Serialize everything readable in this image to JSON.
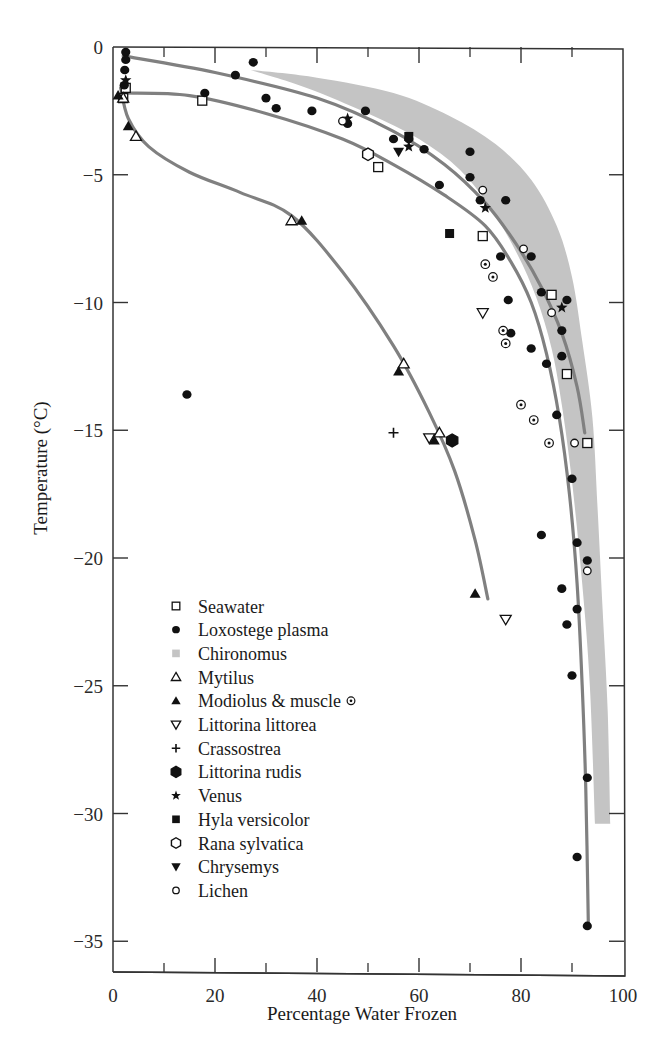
{
  "chart_data": {
    "type": "scatter",
    "title": "",
    "xlabel": "Percentage Water Frozen",
    "ylabel": "Temperature (°C)",
    "xlim": [
      0,
      100
    ],
    "ylim": [
      -36,
      0
    ],
    "x_ticks": [
      0,
      20,
      40,
      60,
      80,
      100
    ],
    "x_minor_ticks": [
      10,
      30,
      50,
      70,
      90
    ],
    "y_ticks": [
      0,
      -5,
      -10,
      -15,
      -20,
      -25,
      -30,
      -35
    ],
    "x_tick_labels": [
      "0",
      "20",
      "40",
      "60",
      "80",
      "100"
    ],
    "y_tick_labels": [
      "0",
      "−5",
      "−10",
      "−15",
      "−20",
      "−25",
      "−30",
      "−35"
    ],
    "grid": false,
    "legend_position": "lower-left inside",
    "colors": {
      "curve": "#808080",
      "band": "#c4c4c4",
      "marker": "#111111",
      "axis": "#333333"
    },
    "series": [
      {
        "name": "Seawater",
        "marker": "open-square",
        "points": [
          [
            2.5,
            -1.6
          ],
          [
            2,
            -2.0
          ],
          [
            17.5,
            -2.1
          ],
          [
            52,
            -4.7
          ],
          [
            72.5,
            -7.4
          ],
          [
            86,
            -9.7
          ],
          [
            89,
            -12.8
          ],
          [
            93,
            -15.5
          ]
        ]
      },
      {
        "name": "Loxostege plasma",
        "marker": "filled-circle",
        "points": [
          [
            2.5,
            -0.2
          ],
          [
            2.5,
            -0.5
          ],
          [
            2.3,
            -0.9
          ],
          [
            2.2,
            -1.5
          ],
          [
            27.5,
            -0.6
          ],
          [
            24,
            -1.1
          ],
          [
            18,
            -1.8
          ],
          [
            30,
            -2.0
          ],
          [
            32,
            -2.4
          ],
          [
            39,
            -2.5
          ],
          [
            46,
            -3.0
          ],
          [
            49.5,
            -2.5
          ],
          [
            55,
            -3.6
          ],
          [
            58,
            -3.6
          ],
          [
            61,
            -4.0
          ],
          [
            64,
            -5.4
          ],
          [
            70,
            -4.1
          ],
          [
            70,
            -5.1
          ],
          [
            72,
            -6.0
          ],
          [
            77,
            -6.0
          ],
          [
            76,
            -8.2
          ],
          [
            82,
            -8.2
          ],
          [
            84,
            -9.6
          ],
          [
            77.5,
            -9.9
          ],
          [
            89,
            -9.9
          ],
          [
            78,
            -11.2
          ],
          [
            88,
            -11.1
          ],
          [
            82,
            -11.8
          ],
          [
            85,
            -12.4
          ],
          [
            88,
            -12.1
          ],
          [
            87,
            -14.4
          ],
          [
            90,
            -16.9
          ],
          [
            84,
            -19.1
          ],
          [
            91,
            -19.4
          ],
          [
            93,
            -20.1
          ],
          [
            88,
            -21.2
          ],
          [
            89,
            -22.6
          ],
          [
            91,
            -22.0
          ],
          [
            90,
            -24.6
          ],
          [
            93,
            -28.6
          ],
          [
            91,
            -31.7
          ],
          [
            93,
            -34.4
          ],
          [
            14.5,
            -13.6
          ]
        ]
      },
      {
        "name": "Chironomus",
        "marker": "gray-band",
        "band_upper": [
          [
            27,
            -0.9
          ],
          [
            40,
            -1.2
          ],
          [
            55,
            -1.8
          ],
          [
            66,
            -2.7
          ],
          [
            75,
            -3.8
          ],
          [
            82,
            -5.2
          ],
          [
            87,
            -7.0
          ],
          [
            90,
            -9.0
          ],
          [
            92,
            -11.5
          ],
          [
            94,
            -14.5
          ],
          [
            95,
            -18
          ],
          [
            96,
            -22
          ],
          [
            97,
            -26
          ],
          [
            97.5,
            -30.4
          ]
        ],
        "band_lower": [
          [
            27,
            -0.9
          ],
          [
            38,
            -1.6
          ],
          [
            50,
            -2.6
          ],
          [
            60,
            -3.6
          ],
          [
            68,
            -4.8
          ],
          [
            74,
            -6.3
          ],
          [
            79,
            -8.0
          ],
          [
            83,
            -9.8
          ],
          [
            86,
            -11.8
          ],
          [
            88,
            -14.0
          ],
          [
            90,
            -17
          ],
          [
            92,
            -21
          ],
          [
            93.5,
            -25
          ],
          [
            94.5,
            -30.4
          ]
        ]
      },
      {
        "name": "Mytilus",
        "marker": "open-triangle",
        "points": [
          [
            2,
            -2.0
          ],
          [
            4.5,
            -3.5
          ],
          [
            35,
            -6.8
          ],
          [
            57,
            -12.4
          ],
          [
            64,
            -15.1
          ]
        ]
      },
      {
        "name": "Modiolus & muscle",
        "marker": "filled-triangle",
        "points": [
          [
            1,
            -1.9
          ],
          [
            3,
            -3.1
          ],
          [
            37,
            -6.8
          ],
          [
            56,
            -12.7
          ],
          [
            63,
            -15.4
          ],
          [
            71,
            -21.4
          ]
        ]
      },
      {
        "name": "Modiolus & muscle (dotted)",
        "marker": "dotted-circle",
        "points": [
          [
            73,
            -8.5
          ],
          [
            74.5,
            -9.0
          ],
          [
            76.5,
            -11.1
          ],
          [
            77,
            -11.6
          ],
          [
            80,
            -14.0
          ],
          [
            82.5,
            -14.6
          ],
          [
            85.5,
            -15.5
          ]
        ]
      },
      {
        "name": "Littorina littorea",
        "marker": "open-inverted-triangle",
        "points": [
          [
            62,
            -15.3
          ],
          [
            72.5,
            -10.4
          ],
          [
            77,
            -22.4
          ]
        ]
      },
      {
        "name": "Crassostrea",
        "marker": "plus",
        "points": [
          [
            55,
            -15.1
          ]
        ]
      },
      {
        "name": "Littorina rudis",
        "marker": "filled-hexagon",
        "points": [
          [
            66.5,
            -15.4
          ]
        ]
      },
      {
        "name": "Venus",
        "marker": "filled-star",
        "points": [
          [
            2.5,
            -1.3
          ],
          [
            46,
            -2.8
          ],
          [
            58,
            -3.9
          ],
          [
            73,
            -6.3
          ],
          [
            88,
            -10.2
          ]
        ]
      },
      {
        "name": "Hyla versicolor",
        "marker": "filled-square",
        "points": [
          [
            58,
            -3.5
          ],
          [
            66,
            -7.3
          ]
        ]
      },
      {
        "name": "Rana sylvatica",
        "marker": "open-hexagon",
        "points": [
          [
            50,
            -4.2
          ]
        ]
      },
      {
        "name": "Chrysemys",
        "marker": "filled-inverted-triangle",
        "points": [
          [
            56,
            -4.1
          ]
        ]
      },
      {
        "name": "Lichen",
        "marker": "open-circle",
        "points": [
          [
            45,
            -2.9
          ],
          [
            72.5,
            -5.6
          ],
          [
            80.5,
            -7.9
          ],
          [
            86,
            -10.4
          ],
          [
            90.5,
            -15.5
          ],
          [
            93,
            -20.5
          ]
        ]
      }
    ],
    "fitted_curves": [
      {
        "name": "Loxostege / upper curve",
        "points": [
          [
            2,
            -0.35
          ],
          [
            20,
            -1.0
          ],
          [
            40,
            -2.0
          ],
          [
            55,
            -3.3
          ],
          [
            65,
            -4.6
          ],
          [
            73,
            -6.1
          ],
          [
            79,
            -7.7
          ],
          [
            84,
            -9.4
          ],
          [
            88,
            -11.2
          ],
          [
            91,
            -13.3
          ],
          [
            92.5,
            -15.1
          ]
        ]
      },
      {
        "name": "Seawater curve",
        "points": [
          [
            2,
            -1.8
          ],
          [
            15,
            -1.9
          ],
          [
            30,
            -2.6
          ],
          [
            45,
            -3.6
          ],
          [
            55,
            -4.6
          ],
          [
            65,
            -5.8
          ],
          [
            73,
            -7.0
          ],
          [
            78,
            -8.4
          ],
          [
            82,
            -10.0
          ],
          [
            85,
            -12.0
          ],
          [
            87.5,
            -14.5
          ],
          [
            89.5,
            -17.5
          ],
          [
            91,
            -21
          ],
          [
            92,
            -25
          ],
          [
            92.7,
            -29
          ],
          [
            93.2,
            -34.3
          ]
        ]
      },
      {
        "name": "Mytilus / Modiolus curve",
        "points": [
          [
            1.5,
            -1.6
          ],
          [
            3,
            -2.8
          ],
          [
            7,
            -3.9
          ],
          [
            15,
            -4.9
          ],
          [
            25,
            -5.7
          ],
          [
            35,
            -6.6
          ],
          [
            45,
            -8.8
          ],
          [
            55,
            -11.7
          ],
          [
            62,
            -14.3
          ],
          [
            67,
            -16.6
          ],
          [
            71,
            -19.3
          ],
          [
            73.5,
            -21.6
          ]
        ]
      }
    ]
  },
  "legend": {
    "items": [
      {
        "label": "Seawater",
        "marker": "open-square"
      },
      {
        "label": "Loxostege plasma",
        "marker": "filled-circle"
      },
      {
        "label": "Chironomus",
        "marker": "gray-band"
      },
      {
        "label": "Mytilus",
        "marker": "open-triangle"
      },
      {
        "label": "Modiolus & muscle",
        "marker": "filled-triangle",
        "extra_marker": "dotted-circle"
      },
      {
        "label": "Littorina littorea",
        "marker": "open-inverted-triangle"
      },
      {
        "label": "Crassostrea",
        "marker": "plus"
      },
      {
        "label": "Littorina rudis",
        "marker": "filled-hexagon"
      },
      {
        "label": "Venus",
        "marker": "filled-star"
      },
      {
        "label": "Hyla versicolor",
        "marker": "filled-square"
      },
      {
        "label": "Rana sylvatica",
        "marker": "open-hexagon"
      },
      {
        "label": "Chrysemys",
        "marker": "filled-inverted-triangle"
      },
      {
        "label": "Lichen",
        "marker": "open-circle"
      }
    ]
  }
}
